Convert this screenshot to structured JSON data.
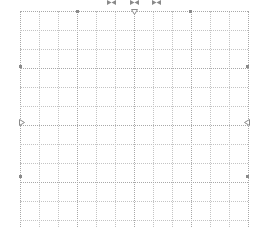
{
  "canvas": {
    "background": "#ffffff",
    "grid_color": "#c4c4c4",
    "grid_major_color": "#a8a8a8",
    "handle_color": "#8a8a8a"
  },
  "grid": {
    "origin": [
      20,
      11
    ],
    "spacing": 19,
    "columns": 12,
    "rows": 12
  },
  "handles": {
    "top_pan_icons": [
      "bowtie-icon",
      "bowtie-icon",
      "bowtie-icon"
    ],
    "top_center": "triangle-down-icon",
    "left_center": "triangle-right-icon",
    "right_center": "triangle-left-icon"
  }
}
